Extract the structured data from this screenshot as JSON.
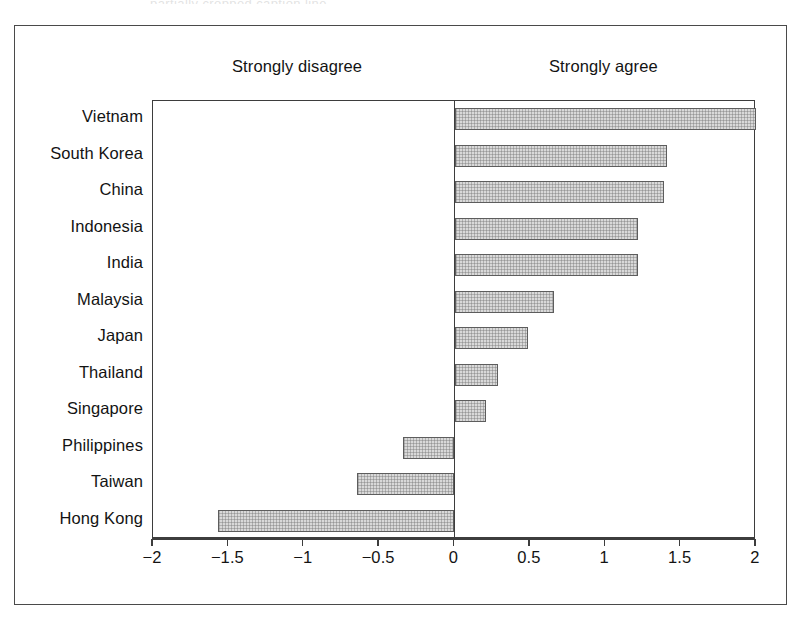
{
  "figure": {
    "background_color": "#ffffff",
    "frame_color": "#4a4a4a",
    "top_clipped_text": "partially cropped caption line"
  },
  "headers": {
    "negative_pole": "Strongly disagree",
    "positive_pole": "Strongly agree"
  },
  "axis": {
    "ticks": [
      "−2",
      "−1.5",
      "−1",
      "−0.5",
      "0",
      "0.5",
      "1",
      "1.5",
      "2"
    ],
    "tick_values": [
      -2,
      -1.5,
      -1,
      -0.5,
      0,
      0.5,
      1,
      1.5,
      2
    ],
    "min": -2,
    "max": 2
  },
  "style": {
    "bar_fill": "#d9d9d9",
    "bar_border": "#5d5d5d",
    "axis_color": "#3d3d3d",
    "text_color": "#131313"
  },
  "chart_data": {
    "type": "bar",
    "orientation": "horizontal",
    "title": "",
    "subtitle": "",
    "xlabel": "",
    "ylabel": "",
    "xlim": [
      -2,
      2
    ],
    "grid": false,
    "legend": false,
    "annotations": [
      "Strongly disagree",
      "Strongly agree"
    ],
    "categories": [
      "Vietnam",
      "South Korea",
      "China",
      "Indonesia",
      "India",
      "Malaysia",
      "Japan",
      "Thailand",
      "Singapore",
      "Philippines",
      "Taiwan",
      "Hong Kong"
    ],
    "values": [
      2.0,
      1.41,
      1.39,
      1.22,
      1.22,
      0.66,
      0.49,
      0.29,
      0.21,
      -0.34,
      -0.65,
      -1.57
    ]
  }
}
